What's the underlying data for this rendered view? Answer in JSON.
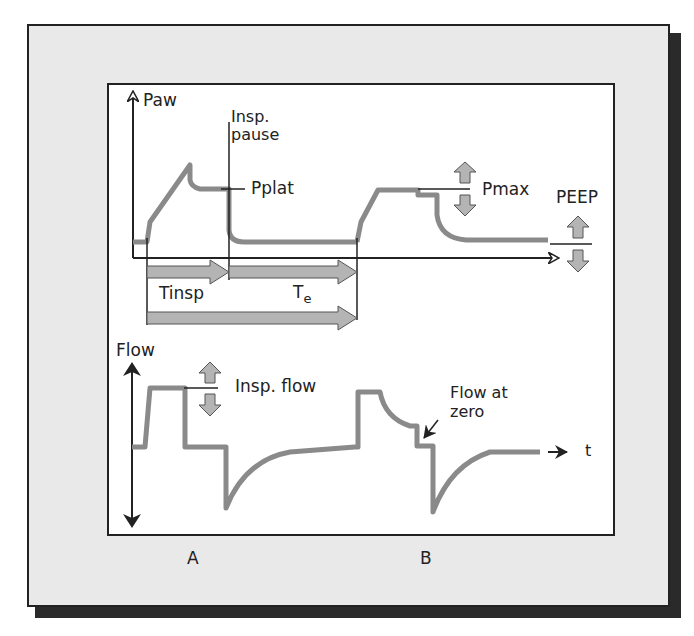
{
  "diagram": {
    "colors": {
      "frame_fill": "#e9e9e9",
      "frame_border": "#222222",
      "panel_fill": "#ffffff",
      "trace": "#8a8a8a",
      "arrow_fill": "#b4b4b4",
      "axis": "#222222"
    },
    "pressure_panel": {
      "y_axis_label": "Paw",
      "insp_pause_label_line1": "Insp.",
      "insp_pause_label_line2": "pause",
      "pplat_label": "Pplat",
      "pmax_label": "Pmax",
      "peep_label": "PEEP"
    },
    "timing": {
      "tinsp_label": "Tinsp",
      "te_label_main": "T",
      "te_label_sub": "e"
    },
    "flow_panel": {
      "y_axis_label": "Flow",
      "insp_flow_label": "Insp. flow",
      "flow_at_zero_line1": "Flow at",
      "flow_at_zero_line2": "zero",
      "time_label": "t"
    },
    "breath_labels": [
      "A",
      "B"
    ]
  }
}
